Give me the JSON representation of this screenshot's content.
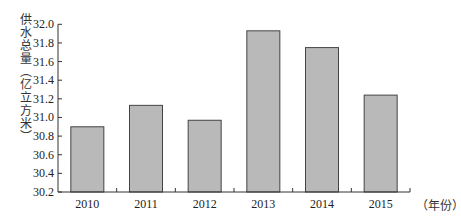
{
  "chart_data": {
    "type": "bar",
    "title": "",
    "xlabel": "（年份）",
    "ylabel": "供水总量（亿立方米）",
    "categories": [
      "2010",
      "2011",
      "2012",
      "2013",
      "2014",
      "2015"
    ],
    "values": [
      30.9,
      31.13,
      30.97,
      31.93,
      31.75,
      31.24
    ],
    "ylim": [
      30.2,
      32.0
    ],
    "yticks": [
      "30.2",
      "30.4",
      "30.6",
      "30.8",
      "31.0",
      "31.2",
      "31.4",
      "31.6",
      "31.8",
      "32.0"
    ],
    "grid": false,
    "legend": null,
    "colors": {
      "bar_fill": "#b9b9b9",
      "bar_stroke": "#444444",
      "axis": "#333333"
    }
  },
  "labels": {
    "ylabel_chars": [
      "供",
      "水",
      "总",
      "量",
      "（",
      "亿",
      "立",
      "方",
      "米",
      "）"
    ],
    "xunit": "（年份）"
  }
}
